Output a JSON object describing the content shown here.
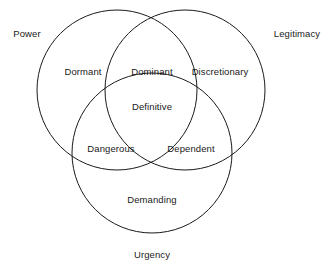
{
  "diagram": {
    "background_color": "#ffffff",
    "stroke_color": "#1a1a1a",
    "text_color": "#1a1a1a"
  },
  "outer_labels": {
    "power": "Power",
    "legitimacy": "Legitimacy",
    "urgency": "Urgency"
  },
  "regions": {
    "dormant": "Dormant",
    "dominant": "Dominant",
    "discretionary": "Discretionary",
    "definitive": "Definitive",
    "dangerous": "Dangerous",
    "dependent": "Dependent",
    "demanding": "Demanding"
  },
  "chart_data": {
    "type": "venn",
    "sets": [
      {
        "name": "Power",
        "label_position": "top-left",
        "cx": 117,
        "cy": 90,
        "r": 80
      },
      {
        "name": "Legitimacy",
        "label_position": "top-right",
        "cx": 185,
        "cy": 90,
        "r": 80
      },
      {
        "name": "Urgency",
        "label_position": "bottom-center",
        "cx": 152,
        "cy": 153,
        "r": 80
      }
    ],
    "regions": [
      {
        "label": "Dormant",
        "sets": [
          "Power"
        ],
        "x": 83,
        "y": 71
      },
      {
        "label": "Dominant",
        "sets": [
          "Power",
          "Legitimacy"
        ],
        "x": 152,
        "y": 71
      },
      {
        "label": "Discretionary",
        "sets": [
          "Legitimacy"
        ],
        "x": 220,
        "y": 71
      },
      {
        "label": "Definitive",
        "sets": [
          "Power",
          "Legitimacy",
          "Urgency"
        ],
        "x": 152,
        "y": 106
      },
      {
        "label": "Dangerous",
        "sets": [
          "Power",
          "Urgency"
        ],
        "x": 111,
        "y": 148
      },
      {
        "label": "Dependent",
        "sets": [
          "Legitimacy",
          "Urgency"
        ],
        "x": 191,
        "y": 148
      },
      {
        "label": "Demanding",
        "sets": [
          "Urgency"
        ],
        "x": 152,
        "y": 199
      }
    ],
    "outer_label_positions": [
      {
        "label": "Power",
        "x": 27,
        "y": 33
      },
      {
        "label": "Legitimacy",
        "x": 297,
        "y": 33
      },
      {
        "label": "Urgency",
        "x": 152,
        "y": 254
      }
    ],
    "grid": false,
    "legend": false
  }
}
